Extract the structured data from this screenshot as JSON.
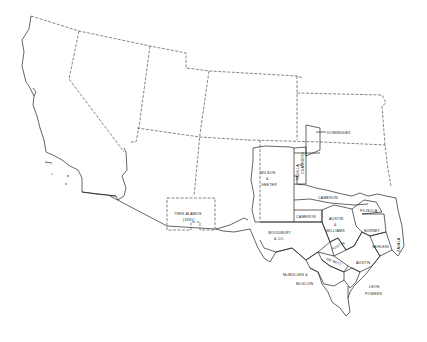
{
  "map": {
    "title": "",
    "grants": [
      {
        "id": "wilson-geeter",
        "lines": [
          "WILSON",
          "&",
          "GEETER"
        ]
      },
      {
        "id": "padilla-chambers",
        "lines": [
          "PADILLA",
          "&",
          "CHAMBERS"
        ]
      },
      {
        "id": "dominguez",
        "lines": [
          "DOMINGUEZ"
        ]
      },
      {
        "id": "cameron-north",
        "lines": [
          "CAMERON"
        ]
      },
      {
        "id": "cameron-south",
        "lines": [
          "CAMERON"
        ]
      },
      {
        "id": "filisola",
        "lines": [
          "FILISOLA"
        ]
      },
      {
        "id": "austin-williams",
        "lines": [
          "AUSTIN",
          "&",
          "WILLIAMS"
        ]
      },
      {
        "id": "burnet",
        "lines": [
          "BURNET"
        ]
      },
      {
        "id": "vehlein",
        "lines": [
          "VEHLEIN"
        ]
      },
      {
        "id": "zavala",
        "lines": [
          "ZAVALA"
        ]
      },
      {
        "id": "woodbury",
        "lines": [
          "WOODBURY",
          "& CO."
        ]
      },
      {
        "id": "austin-2",
        "lines": [
          "AUSTIN"
        ]
      },
      {
        "id": "de-witt",
        "lines": [
          "DE WITT"
        ]
      },
      {
        "id": "austin-small",
        "lines": [
          "AUSTIN"
        ]
      },
      {
        "id": "mcmullen-mcgloin",
        "lines": [
          "McMULLEN &",
          "McGLOIN"
        ]
      },
      {
        "id": "leon-powers",
        "lines": [
          "LEON",
          "POWERS"
        ]
      },
      {
        "id": "tres-alamos",
        "lines": [
          "TRES ALAMOS",
          "(1831)"
        ]
      }
    ]
  }
}
